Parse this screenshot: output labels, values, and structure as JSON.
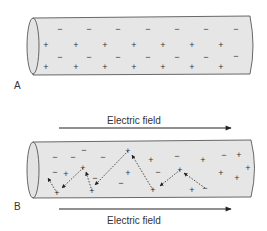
{
  "panel_a": {
    "label": "A",
    "charges": [
      {
        "t": "−",
        "x": 60,
        "y": 29
      },
      {
        "t": "−",
        "x": 89,
        "y": 29
      },
      {
        "t": "−",
        "x": 118,
        "y": 29
      },
      {
        "t": "−",
        "x": 148,
        "y": 29
      },
      {
        "t": "−",
        "x": 177,
        "y": 29
      },
      {
        "t": "−",
        "x": 206,
        "y": 29
      },
      {
        "t": "−",
        "x": 236,
        "y": 29
      },
      {
        "t": "+",
        "x": 46,
        "y": 45
      },
      {
        "t": "+",
        "x": 76,
        "y": 45
      },
      {
        "t": "+",
        "x": 105,
        "y": 45
      },
      {
        "t": "+",
        "x": 134,
        "y": 45
      },
      {
        "t": "+",
        "x": 163,
        "y": 45
      },
      {
        "t": "+",
        "x": 192,
        "y": 45
      },
      {
        "t": "+",
        "x": 221,
        "y": 45
      },
      {
        "t": "−",
        "x": 60,
        "y": 57
      },
      {
        "t": "−",
        "x": 89,
        "y": 57
      },
      {
        "t": "−",
        "x": 118,
        "y": 57
      },
      {
        "t": "−",
        "x": 148,
        "y": 57
      },
      {
        "t": "−",
        "x": 177,
        "y": 57
      },
      {
        "t": "−",
        "x": 206,
        "y": 57
      },
      {
        "t": "−",
        "x": 236,
        "y": 56
      },
      {
        "t": "+",
        "x": 46,
        "y": 67
      },
      {
        "t": "+",
        "x": 76,
        "y": 67
      },
      {
        "t": "+",
        "x": 105,
        "y": 67
      },
      {
        "t": "+",
        "x": 134,
        "y": 67
      },
      {
        "t": "+",
        "x": 163,
        "y": 67
      },
      {
        "t": "+",
        "x": 192,
        "y": 67
      },
      {
        "t": "+",
        "x": 221,
        "y": 67
      }
    ]
  },
  "panel_b": {
    "label": "B",
    "field_label_top": "Electric field",
    "field_label_bottom": "Electric field",
    "charges": [
      {
        "t": "−",
        "x": 55,
        "y": 157
      },
      {
        "t": "−",
        "x": 73,
        "y": 157
      },
      {
        "t": "−",
        "x": 84,
        "y": 150
      },
      {
        "t": "−",
        "x": 103,
        "y": 157
      },
      {
        "t": "+",
        "x": 128,
        "y": 151
      },
      {
        "t": "+",
        "x": 151,
        "y": 160
      },
      {
        "t": "−",
        "x": 177,
        "y": 156
      },
      {
        "t": "+",
        "x": 203,
        "y": 160
      },
      {
        "t": "−",
        "x": 224,
        "y": 155
      },
      {
        "t": "+",
        "x": 239,
        "y": 155
      },
      {
        "t": "−",
        "x": 55,
        "y": 172
      },
      {
        "t": "+",
        "x": 66,
        "y": 174
      },
      {
        "t": "+",
        "x": 83,
        "y": 168
      },
      {
        "t": "−",
        "x": 95,
        "y": 178
      },
      {
        "t": "+",
        "x": 128,
        "y": 173
      },
      {
        "t": "−",
        "x": 121,
        "y": 183
      },
      {
        "t": "−",
        "x": 158,
        "y": 172
      },
      {
        "t": "+",
        "x": 180,
        "y": 170
      },
      {
        "t": "+",
        "x": 221,
        "y": 173
      },
      {
        "t": "+",
        "x": 248,
        "y": 168
      },
      {
        "t": "+",
        "x": 237,
        "y": 178
      },
      {
        "t": "+",
        "x": 57,
        "y": 193
      },
      {
        "t": "+",
        "x": 92,
        "y": 191
      },
      {
        "t": "+",
        "x": 153,
        "y": 190
      },
      {
        "t": "+",
        "x": 192,
        "y": 190
      },
      {
        "t": "−",
        "x": 205,
        "y": 188
      }
    ],
    "paths": [
      {
        "from": [
          57,
          193
        ],
        "to": [
          48,
          178
        ]
      },
      {
        "from": [
          83,
          168
        ],
        "to": [
          62,
          188
        ]
      },
      {
        "from": [
          92,
          191
        ],
        "to": [
          86,
          172
        ]
      },
      {
        "from": [
          128,
          151
        ],
        "to": [
          95,
          185
        ]
      },
      {
        "from": [
          153,
          190
        ],
        "to": [
          132,
          155
        ]
      },
      {
        "from": [
          180,
          170
        ],
        "to": [
          160,
          186
        ]
      },
      {
        "from": [
          205,
          188
        ],
        "to": [
          184,
          173
        ]
      }
    ]
  },
  "colors": {
    "tube_fill": "#e6e6e6",
    "stroke": "#333333"
  }
}
